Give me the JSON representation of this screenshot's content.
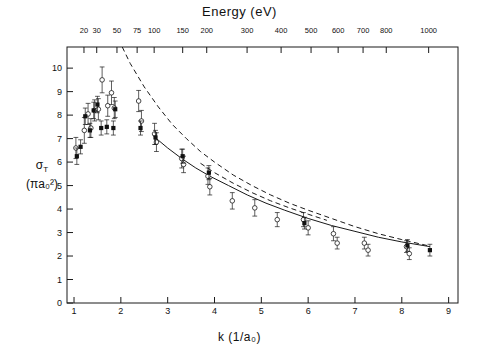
{
  "figure": {
    "top_axis_title": "Energy (eV)",
    "bottom_axis_title": "k (1/a₀)",
    "y_axis_title_line1": "σ",
    "y_axis_title_sub": "T",
    "y_axis_title_line2": "(πa₀²)"
  },
  "chart_data": {
    "type": "scatter",
    "title": "Energy (eV)",
    "xlabel": "k (1/a₀)",
    "ylabel": "σ_T (πa₀²)",
    "xlim": [
      0.85,
      9.2
    ],
    "ylim": [
      0,
      10.9
    ],
    "grid": false,
    "legend": "none",
    "x_ticks": [
      1,
      2,
      3,
      4,
      5,
      6,
      7,
      8,
      9
    ],
    "x_tick_labels": [
      "1",
      "2",
      "3",
      "4",
      "5",
      "6",
      "7",
      "8",
      "9"
    ],
    "y_ticks": [
      0,
      1,
      2,
      3,
      4,
      5,
      6,
      7,
      8,
      9,
      10
    ],
    "y_tick_labels": [
      "0",
      "1",
      "2",
      "3",
      "4",
      "5",
      "6",
      "7",
      "8",
      "9",
      "10"
    ],
    "secondary_x_axis": {
      "label": "Energy (eV)",
      "relation": "E = 13.6059 * k^2",
      "ticks": [
        20,
        30,
        50,
        75,
        100,
        150,
        200,
        300,
        400,
        500,
        600,
        700,
        800,
        1000
      ],
      "tick_labels": [
        "20",
        "30",
        "50",
        "75",
        "100",
        "150",
        "200",
        "300",
        "400",
        "500",
        "600",
        "700",
        "800",
        "1000"
      ]
    },
    "series": [
      {
        "name": "open-circle-measurements",
        "marker": "open-circle",
        "points": [
          {
            "x": 1.04,
            "y": 6.6,
            "yerr": 0.45
          },
          {
            "x": 1.22,
            "y": 7.35,
            "yerr": 0.55
          },
          {
            "x": 1.3,
            "y": 8.05,
            "yerr": 0.45
          },
          {
            "x": 1.36,
            "y": 7.45,
            "yerr": 0.4
          },
          {
            "x": 1.44,
            "y": 8.2,
            "yerr": 0.45
          },
          {
            "x": 1.52,
            "y": 8.25,
            "yerr": 0.45
          },
          {
            "x": 1.6,
            "y": 9.5,
            "yerr": 0.55
          },
          {
            "x": 1.72,
            "y": 8.4,
            "yerr": 0.45
          },
          {
            "x": 1.8,
            "y": 8.95,
            "yerr": 0.5
          },
          {
            "x": 1.86,
            "y": 8.3,
            "yerr": 0.45
          },
          {
            "x": 2.38,
            "y": 8.6,
            "yerr": 0.45
          },
          {
            "x": 2.44,
            "y": 7.75,
            "yerr": 0.45
          },
          {
            "x": 2.72,
            "y": 7.2,
            "yerr": 0.45
          },
          {
            "x": 2.76,
            "y": 6.85,
            "yerr": 0.4
          },
          {
            "x": 3.3,
            "y": 6.15,
            "yerr": 0.4
          },
          {
            "x": 3.34,
            "y": 5.9,
            "yerr": 0.35
          },
          {
            "x": 3.86,
            "y": 5.4,
            "yerr": 0.35
          },
          {
            "x": 3.9,
            "y": 4.95,
            "yerr": 0.35
          },
          {
            "x": 4.38,
            "y": 4.35,
            "yerr": 0.35
          },
          {
            "x": 4.86,
            "y": 4.05,
            "yerr": 0.35
          },
          {
            "x": 5.34,
            "y": 3.55,
            "yerr": 0.3
          },
          {
            "x": 5.9,
            "y": 3.55,
            "yerr": 0.3
          },
          {
            "x": 6.0,
            "y": 3.2,
            "yerr": 0.3
          },
          {
            "x": 6.54,
            "y": 2.95,
            "yerr": 0.3
          },
          {
            "x": 6.62,
            "y": 2.55,
            "yerr": 0.25
          },
          {
            "x": 7.2,
            "y": 2.55,
            "yerr": 0.25
          },
          {
            "x": 7.28,
            "y": 2.25,
            "yerr": 0.25
          },
          {
            "x": 8.1,
            "y": 2.4,
            "yerr": 0.25
          },
          {
            "x": 8.16,
            "y": 2.1,
            "yerr": 0.25
          }
        ]
      },
      {
        "name": "filled-square-measurements",
        "marker": "filled-square",
        "points": [
          {
            "x": 1.06,
            "y": 6.25,
            "yerr": 0.35
          },
          {
            "x": 1.14,
            "y": 6.65,
            "yerr": 0.3
          },
          {
            "x": 1.24,
            "y": 7.95,
            "yerr": 0.35
          },
          {
            "x": 1.34,
            "y": 7.35,
            "yerr": 0.3
          },
          {
            "x": 1.42,
            "y": 8.2,
            "yerr": 0.35
          },
          {
            "x": 1.5,
            "y": 8.45,
            "yerr": 0.35
          },
          {
            "x": 1.58,
            "y": 7.45,
            "yerr": 0.3
          },
          {
            "x": 1.7,
            "y": 7.5,
            "yerr": 0.3
          },
          {
            "x": 1.84,
            "y": 7.45,
            "yerr": 0.3
          },
          {
            "x": 1.88,
            "y": 8.25,
            "yerr": 0.35
          },
          {
            "x": 2.42,
            "y": 7.45,
            "yerr": 0.3
          },
          {
            "x": 2.74,
            "y": 7.05,
            "yerr": 0.3
          },
          {
            "x": 3.32,
            "y": 6.25,
            "yerr": 0.3
          },
          {
            "x": 3.88,
            "y": 5.55,
            "yerr": 0.3
          },
          {
            "x": 5.92,
            "y": 3.4,
            "yerr": 0.25
          },
          {
            "x": 8.12,
            "y": 2.45,
            "yerr": 0.25
          },
          {
            "x": 8.6,
            "y": 2.25,
            "yerr": 0.25
          }
        ]
      }
    ],
    "curves": [
      {
        "name": "solid-theory-curve",
        "style": "solid",
        "points": [
          {
            "x": 2.7,
            "y": 7.1
          },
          {
            "x": 3.0,
            "y": 6.6
          },
          {
            "x": 3.3,
            "y": 6.15
          },
          {
            "x": 3.6,
            "y": 5.75
          },
          {
            "x": 3.9,
            "y": 5.4
          },
          {
            "x": 4.3,
            "y": 5.0
          },
          {
            "x": 4.7,
            "y": 4.6
          },
          {
            "x": 5.1,
            "y": 4.25
          },
          {
            "x": 5.5,
            "y": 3.95
          },
          {
            "x": 6.0,
            "y": 3.6
          },
          {
            "x": 6.5,
            "y": 3.3
          },
          {
            "x": 7.0,
            "y": 3.05
          },
          {
            "x": 7.5,
            "y": 2.8
          },
          {
            "x": 8.0,
            "y": 2.6
          },
          {
            "x": 8.6,
            "y": 2.4
          }
        ]
      },
      {
        "name": "dashed-theory-curve-upper",
        "style": "dashed",
        "points": [
          {
            "x": 2.03,
            "y": 10.9
          },
          {
            "x": 2.2,
            "y": 10.2
          },
          {
            "x": 2.5,
            "y": 9.2
          },
          {
            "x": 2.8,
            "y": 8.35
          },
          {
            "x": 3.1,
            "y": 7.6
          },
          {
            "x": 3.4,
            "y": 7.0
          },
          {
            "x": 3.7,
            "y": 6.45
          },
          {
            "x": 4.0,
            "y": 6.0
          },
          {
            "x": 4.4,
            "y": 5.45
          },
          {
            "x": 4.8,
            "y": 5.0
          },
          {
            "x": 5.2,
            "y": 4.6
          },
          {
            "x": 5.6,
            "y": 4.25
          },
          {
            "x": 6.0,
            "y": 3.95
          },
          {
            "x": 6.5,
            "y": 3.6
          },
          {
            "x": 7.0,
            "y": 3.25
          },
          {
            "x": 7.5,
            "y": 2.95
          },
          {
            "x": 8.0,
            "y": 2.7
          },
          {
            "x": 8.6,
            "y": 2.42
          }
        ]
      },
      {
        "name": "dashed-theory-curve-lower",
        "style": "dashed",
        "points": [
          {
            "x": 3.7,
            "y": 5.95
          },
          {
            "x": 4.0,
            "y": 5.55
          },
          {
            "x": 4.4,
            "y": 5.1
          },
          {
            "x": 4.8,
            "y": 4.7
          },
          {
            "x": 5.2,
            "y": 4.35
          },
          {
            "x": 5.6,
            "y": 4.05
          },
          {
            "x": 6.0,
            "y": 3.78
          },
          {
            "x": 6.4,
            "y": 3.52
          }
        ]
      }
    ]
  }
}
